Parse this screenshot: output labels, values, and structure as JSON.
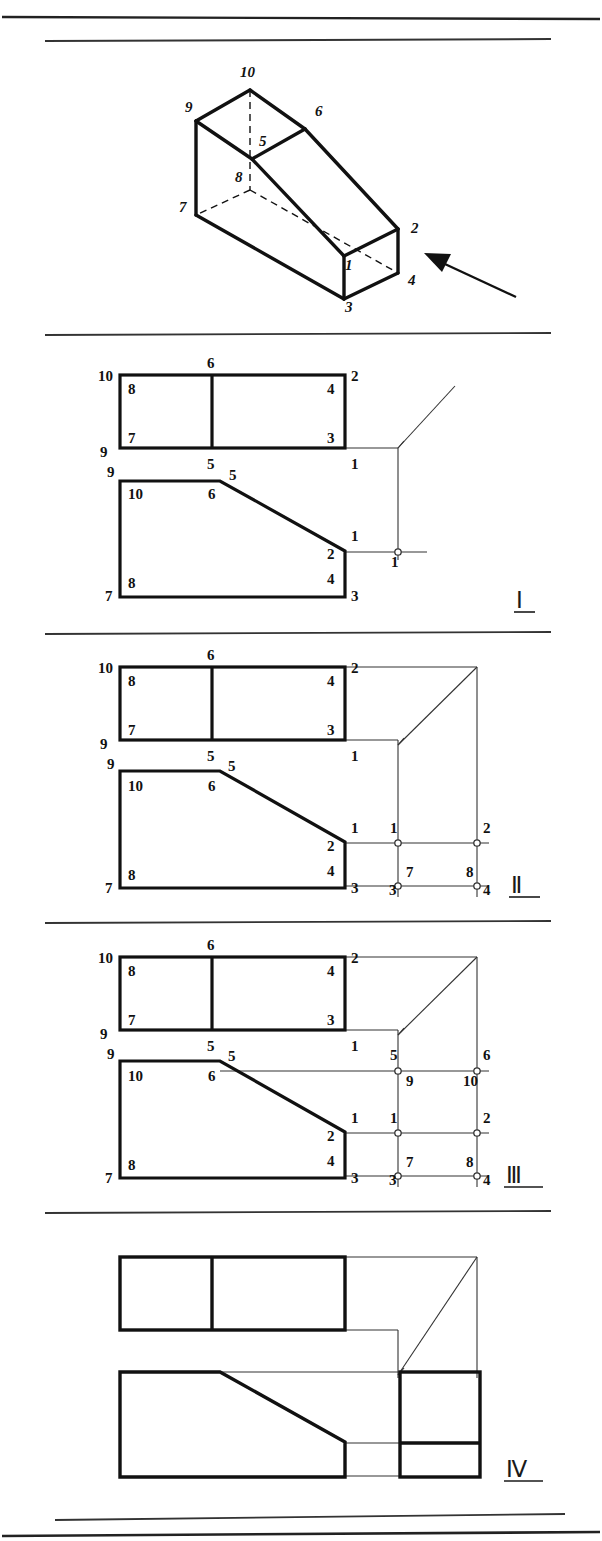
{
  "page": {
    "width": 602,
    "height": 1541,
    "background": "#ffffff",
    "ink": "#111111",
    "thin_ink": "#333333"
  },
  "rules": {
    "top_outer": "horizontal-rule",
    "top_inner": "horizontal-rule",
    "divider_1": "horizontal-rule",
    "divider_2": "horizontal-rule",
    "divider_3": "horizontal-rule",
    "divider_4": "horizontal-rule",
    "bottom_inner": "horizontal-rule",
    "bottom_outer": "horizontal-rule"
  },
  "isometric": {
    "caption": "isometric-pictorial",
    "view_arrow": "viewing-direction-arrow",
    "labels": [
      {
        "text": "10",
        "x": 240,
        "y": 77
      },
      {
        "text": "9",
        "x": 185,
        "y": 112
      },
      {
        "text": "6",
        "x": 315,
        "y": 116
      },
      {
        "text": "5",
        "x": 259,
        "y": 146
      },
      {
        "text": "8",
        "x": 235,
        "y": 182
      },
      {
        "text": "7",
        "x": 179,
        "y": 212
      },
      {
        "text": "2",
        "x": 411,
        "y": 233
      },
      {
        "text": "1",
        "x": 345,
        "y": 270
      },
      {
        "text": "4",
        "x": 408,
        "y": 285
      },
      {
        "text": "3",
        "x": 345,
        "y": 312
      }
    ]
  },
  "steps": [
    {
      "id": "step-1",
      "roman": "Ⅰ",
      "caption": "step-one-top-and-front-views",
      "top_view_labels": [
        {
          "text": "10",
          "x": 98,
          "y": 381
        },
        {
          "text": "8",
          "x": 128,
          "y": 394
        },
        {
          "text": "6",
          "x": 207,
          "y": 368
        },
        {
          "text": "4",
          "x": 327,
          "y": 394
        },
        {
          "text": "2",
          "x": 351,
          "y": 381
        },
        {
          "text": "7",
          "x": 128,
          "y": 443
        },
        {
          "text": "3",
          "x": 327,
          "y": 443
        },
        {
          "text": "9",
          "x": 100,
          "y": 457
        },
        {
          "text": "5",
          "x": 207,
          "y": 469
        },
        {
          "text": "1",
          "x": 351,
          "y": 469
        }
      ],
      "front_view_labels": [
        {
          "text": "9",
          "x": 107,
          "y": 477
        },
        {
          "text": "10",
          "x": 128,
          "y": 499
        },
        {
          "text": "6",
          "x": 208,
          "y": 499
        },
        {
          "text": "5",
          "x": 229,
          "y": 480
        },
        {
          "text": "1",
          "x": 351,
          "y": 541
        },
        {
          "text": "2",
          "x": 327,
          "y": 559
        },
        {
          "text": "8",
          "x": 128,
          "y": 588
        },
        {
          "text": "4",
          "x": 327,
          "y": 584
        },
        {
          "text": "7",
          "x": 105,
          "y": 601
        },
        {
          "text": "3",
          "x": 351,
          "y": 601
        }
      ],
      "side_labels": [
        {
          "text": "1",
          "x": 391,
          "y": 567
        }
      ]
    },
    {
      "id": "step-2",
      "roman": "Ⅱ",
      "caption": "step-two-projectors-to-side-view",
      "top_view_labels": [
        {
          "text": "10",
          "x": 98,
          "y": 673
        },
        {
          "text": "8",
          "x": 128,
          "y": 686
        },
        {
          "text": "6",
          "x": 207,
          "y": 660
        },
        {
          "text": "4",
          "x": 327,
          "y": 686
        },
        {
          "text": "2",
          "x": 351,
          "y": 673
        },
        {
          "text": "7",
          "x": 128,
          "y": 735
        },
        {
          "text": "3",
          "x": 327,
          "y": 735
        },
        {
          "text": "9",
          "x": 100,
          "y": 749
        },
        {
          "text": "5",
          "x": 207,
          "y": 761
        },
        {
          "text": "1",
          "x": 351,
          "y": 761
        }
      ],
      "front_view_labels": [
        {
          "text": "9",
          "x": 107,
          "y": 769
        },
        {
          "text": "5",
          "x": 228,
          "y": 771
        },
        {
          "text": "10",
          "x": 128,
          "y": 791
        },
        {
          "text": "6",
          "x": 208,
          "y": 791
        },
        {
          "text": "1",
          "x": 351,
          "y": 833
        },
        {
          "text": "2",
          "x": 327,
          "y": 851
        },
        {
          "text": "8",
          "x": 128,
          "y": 880
        },
        {
          "text": "4",
          "x": 327,
          "y": 876
        },
        {
          "text": "7",
          "x": 105,
          "y": 893
        },
        {
          "text": "3",
          "x": 351,
          "y": 893
        }
      ],
      "side_labels": [
        {
          "text": "1",
          "x": 390,
          "y": 833
        },
        {
          "text": "2",
          "x": 483,
          "y": 833
        },
        {
          "text": "7",
          "x": 406,
          "y": 877
        },
        {
          "text": "8",
          "x": 466,
          "y": 877
        },
        {
          "text": "3",
          "x": 389,
          "y": 895
        },
        {
          "text": "4",
          "x": 483,
          "y": 895
        }
      ]
    },
    {
      "id": "step-3",
      "roman": "Ⅲ",
      "caption": "step-three-complete-side-view-points",
      "top_view_labels": [
        {
          "text": "10",
          "x": 98,
          "y": 963
        },
        {
          "text": "8",
          "x": 128,
          "y": 976
        },
        {
          "text": "6",
          "x": 207,
          "y": 950
        },
        {
          "text": "4",
          "x": 327,
          "y": 976
        },
        {
          "text": "2",
          "x": 351,
          "y": 963
        },
        {
          "text": "7",
          "x": 128,
          "y": 1025
        },
        {
          "text": "3",
          "x": 327,
          "y": 1025
        },
        {
          "text": "9",
          "x": 100,
          "y": 1039
        },
        {
          "text": "5",
          "x": 207,
          "y": 1051
        },
        {
          "text": "1",
          "x": 351,
          "y": 1051
        }
      ],
      "front_view_labels": [
        {
          "text": "9",
          "x": 107,
          "y": 1059
        },
        {
          "text": "5",
          "x": 228,
          "y": 1061
        },
        {
          "text": "10",
          "x": 128,
          "y": 1081
        },
        {
          "text": "6",
          "x": 208,
          "y": 1081
        },
        {
          "text": "1",
          "x": 351,
          "y": 1123
        },
        {
          "text": "2",
          "x": 327,
          "y": 1141
        },
        {
          "text": "8",
          "x": 128,
          "y": 1170
        },
        {
          "text": "4",
          "x": 327,
          "y": 1166
        },
        {
          "text": "7",
          "x": 105,
          "y": 1183
        },
        {
          "text": "3",
          "x": 351,
          "y": 1183
        }
      ],
      "side_labels": [
        {
          "text": "5",
          "x": 390,
          "y": 1060
        },
        {
          "text": "6",
          "x": 483,
          "y": 1060
        },
        {
          "text": "9",
          "x": 406,
          "y": 1086
        },
        {
          "text": "10",
          "x": 463,
          "y": 1086
        },
        {
          "text": "1",
          "x": 390,
          "y": 1123
        },
        {
          "text": "2",
          "x": 483,
          "y": 1123
        },
        {
          "text": "7",
          "x": 406,
          "y": 1167
        },
        {
          "text": "8",
          "x": 466,
          "y": 1167
        },
        {
          "text": "3",
          "x": 389,
          "y": 1185
        },
        {
          "text": "4",
          "x": 483,
          "y": 1185
        }
      ]
    },
    {
      "id": "step-4",
      "roman": "Ⅳ",
      "caption": "step-four-finished-three-view-drawing",
      "top_view_labels": [],
      "front_view_labels": [],
      "side_labels": []
    }
  ],
  "chart_data": {
    "type": "diagram",
    "object_vertices": [
      1,
      2,
      3,
      4,
      5,
      6,
      7,
      8,
      9,
      10
    ],
    "views": [
      "top view",
      "front view",
      "right side view"
    ],
    "construction": [
      "45-degree miter line",
      "horizontal projectors",
      "vertical projectors"
    ],
    "steps_count": 4
  }
}
